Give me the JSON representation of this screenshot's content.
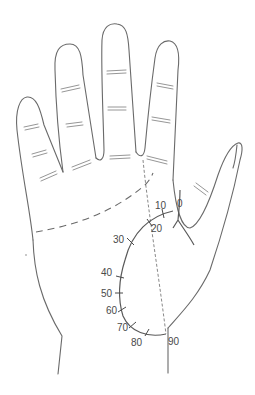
{
  "diagram": {
    "type": "palmistry-life-line-age-scale",
    "scale": {
      "line": "life-line",
      "unit": "age (years)",
      "labels": [
        "0",
        "10",
        "20",
        "30",
        "40",
        "50",
        "60",
        "70",
        "80",
        "90"
      ]
    },
    "colors": {
      "outline": "#6a6a6a",
      "text": "#4a4a4a",
      "background": "#ffffff"
    }
  }
}
